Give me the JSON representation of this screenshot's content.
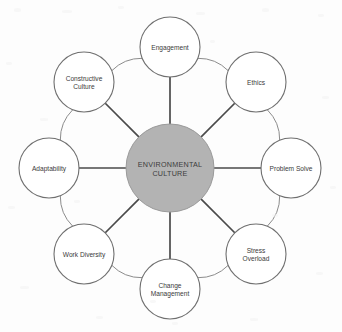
{
  "diagram": {
    "type": "hub-and-spoke radial diagram",
    "hub": {
      "line1": "ENVIRONMENTAL",
      "line2": "CULTURE",
      "fill_color": "#b3b3b3",
      "text_color": "#3c3c3c",
      "cx": 170,
      "cy": 168,
      "r": 44
    },
    "ring": {
      "radius": 121,
      "node_radius": 30,
      "spoke_color": "#4a4a4a",
      "link_color": "#8c8c8c",
      "node_fill": "#ffffff",
      "node_stroke": "#6f6f6f"
    },
    "nodes": [
      {
        "id": "engagement",
        "line1": "Engagement",
        "line2": "",
        "angle": -90,
        "cx": 170,
        "cy": 47
      },
      {
        "id": "ethics",
        "line1": "Ethics",
        "line2": "",
        "angle": -45,
        "cx": 256,
        "cy": 82
      },
      {
        "id": "problem-solve",
        "line1": "Problem Solve",
        "line2": "",
        "angle": 0,
        "cx": 291,
        "cy": 168
      },
      {
        "id": "stress-overload",
        "line1": "Stress",
        "line2": "Overload",
        "angle": 45,
        "cx": 256,
        "cy": 254
      },
      {
        "id": "change-management",
        "line1": "Change",
        "line2": "Management",
        "angle": 90,
        "cx": 170,
        "cy": 289
      },
      {
        "id": "work-diversity",
        "line1": "Work Diversity",
        "line2": "",
        "angle": 135,
        "cx": 84,
        "cy": 254
      },
      {
        "id": "adaptability",
        "line1": "Adaptability",
        "line2": "",
        "angle": 180,
        "cx": 49,
        "cy": 168
      },
      {
        "id": "constructive-culture",
        "line1": "Constructive",
        "line2": "Culture",
        "angle": -135,
        "cx": 84,
        "cy": 82
      }
    ]
  }
}
